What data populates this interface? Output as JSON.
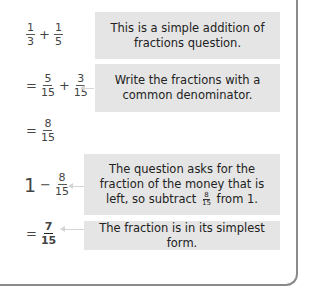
{
  "steps": [
    {
      "expression": {
        "parts": [
          {
            "type": "frac",
            "num": "1",
            "den": "3"
          },
          {
            "type": "op",
            "text": "+"
          },
          {
            "type": "frac",
            "num": "1",
            "den": "5"
          }
        ]
      },
      "note": "This is a simple addition of fractions question."
    },
    {
      "expression": {
        "parts": [
          {
            "type": "op",
            "text": "="
          },
          {
            "type": "frac",
            "num": "5",
            "den": "15"
          },
          {
            "type": "op",
            "text": "+"
          },
          {
            "type": "frac",
            "num": "3",
            "den": "15"
          }
        ]
      },
      "note": "Write the fractions with a common denominator."
    },
    {
      "expression": {
        "parts": [
          {
            "type": "op",
            "text": "="
          },
          {
            "type": "frac",
            "num": "8",
            "den": "15"
          }
        ]
      },
      "note": ""
    },
    {
      "expression": {
        "parts": [
          {
            "type": "op",
            "text": "1"
          },
          {
            "type": "op",
            "text": "−"
          },
          {
            "type": "frac",
            "num": "8",
            "den": "15"
          }
        ]
      },
      "note_before": "The question asks for the fraction of the money that is left, so subtract",
      "note_frac": {
        "num": "8",
        "den": "15"
      },
      "note_after": "from 1."
    },
    {
      "expression": {
        "parts": [
          {
            "type": "op",
            "text": "="
          },
          {
            "type": "frac",
            "num": "7",
            "den": "15",
            "bold": true
          }
        ]
      },
      "note": "The fraction is in its simplest form."
    }
  ]
}
